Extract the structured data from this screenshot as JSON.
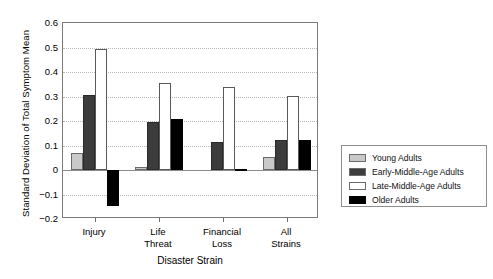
{
  "chart_data": {
    "type": "bar",
    "title": "",
    "xlabel": "Disaster Strain",
    "ylabel": "Standard Deviation of Total Symptom Mean",
    "categories": [
      "Injury",
      "Life\nThreat",
      "Financial\nLoss",
      "All\nStrains"
    ],
    "ylim": [
      -0.2,
      0.6
    ],
    "yticks": [
      -0.2,
      -0.1,
      0,
      0.1,
      0.2,
      0.3,
      0.4,
      0.5,
      0.6
    ],
    "ytick_labels": [
      "−0.2",
      "−0.1",
      "0",
      "0.1",
      "0.2",
      "0.3",
      "0.4",
      "0.5",
      "0.6"
    ],
    "grid": true,
    "legend_position": "right",
    "series": [
      {
        "name": "Young Adults",
        "color": "#c9c9c9",
        "values": [
          0.068,
          0.013,
          0.0,
          0.052
        ]
      },
      {
        "name": "Early-Middle-Age Adults",
        "color": "#3c3c3c",
        "values": [
          0.308,
          0.196,
          0.116,
          0.124
        ]
      },
      {
        "name": "Late-Middle-Age Adults",
        "color": "#ffffff",
        "values": [
          0.494,
          0.356,
          0.339,
          0.304
        ]
      },
      {
        "name": "Older Adults",
        "color": "#000000",
        "values": [
          -0.146,
          0.208,
          0.005,
          0.122
        ]
      }
    ]
  },
  "legend": {
    "items": [
      {
        "label": "Young Adults",
        "color": "#c9c9c9"
      },
      {
        "label": "Early-Middle-Age Adults",
        "color": "#3c3c3c"
      },
      {
        "label": "Late-Middle-Age Adults",
        "color": "#ffffff"
      },
      {
        "label": "Older Adults",
        "color": "#000000"
      }
    ]
  }
}
